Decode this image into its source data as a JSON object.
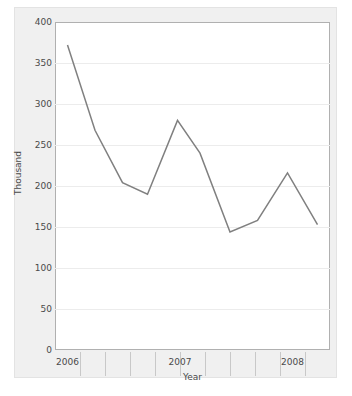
{
  "chart_data": {
    "type": "line",
    "title": "",
    "xlabel": "Year",
    "ylabel": "Thousand",
    "ylim": [
      0,
      400
    ],
    "yticks": [
      0,
      50,
      100,
      150,
      200,
      250,
      300,
      350,
      400
    ],
    "ytick_labels": [
      "0",
      "50",
      "100",
      "150",
      "200",
      "250",
      "300",
      "350",
      "400"
    ],
    "xlim": [
      0,
      11
    ],
    "xticks": [
      0.5,
      5.0,
      9.5
    ],
    "xtick_labels": [
      "2006",
      "2007",
      "2008"
    ],
    "categories": [
      "2006",
      "2007",
      "2008"
    ],
    "grid": "horizontal",
    "legend": "none",
    "series": [
      {
        "name": "Thousand",
        "color": "#808080",
        "x": [
          0.5,
          1.6,
          2.7,
          3.7,
          4.9,
          5.8,
          7.0,
          8.1,
          9.3,
          10.5
        ],
        "values": [
          372,
          268,
          204,
          190,
          280,
          240,
          144,
          158,
          216,
          153
        ]
      }
    ]
  },
  "axes": {
    "y_axis_title": "Thousand",
    "x_axis_title": "Year",
    "y_tick_values": [
      "400",
      "350",
      "300",
      "250",
      "200",
      "150",
      "100",
      "50",
      "0"
    ],
    "x_tick_values": [
      "2006",
      "2007",
      "2008"
    ]
  },
  "colors": {
    "line": "#808080",
    "panel_background": "#f0f0f0",
    "plot_background": "#ffffff",
    "gridline": "#ececec",
    "axis_border": "#b0b0b0",
    "tick_text": "#4a4a4a"
  },
  "artifact": {
    "bottom_text": ""
  }
}
